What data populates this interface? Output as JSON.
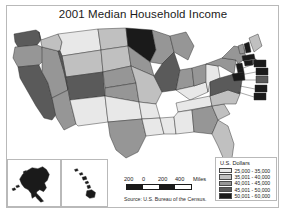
{
  "title": "2001 Median Household Income",
  "source_note": "Source: U.S. Bureau of the Census.",
  "legend": {
    "title": "U.S. Dollars",
    "classes": [
      {
        "label": "25,000 - 35,000",
        "color": "#e8e8e8"
      },
      {
        "label": "35,001 - 40,000",
        "color": "#c0c0c0"
      },
      {
        "label": "40,001 - 45,000",
        "color": "#969696"
      },
      {
        "label": "45,001 - 50,000",
        "color": "#5a5a5a"
      },
      {
        "label": "50,001 - 60,000",
        "color": "#1a1a1a"
      }
    ]
  },
  "scale_bar": {
    "units": "Miles",
    "ticks": [
      "200",
      "0",
      "200",
      "400",
      "Miles"
    ]
  },
  "insets": [
    {
      "name": "Alaska",
      "color": "#1a1a1a"
    },
    {
      "name": "Hawaii",
      "color": "#1a1a1a"
    }
  ],
  "chart_data": {
    "type": "heatmap",
    "title": "2001 Median Household Income",
    "legend_title": "U.S. Dollars",
    "legend_position": "bottom-right",
    "categories": [
      "25,000 - 35,000",
      "35,001 - 40,000",
      "40,001 - 45,000",
      "45,001 - 50,000",
      "50,001 - 60,000"
    ],
    "colors": [
      "#e8e8e8",
      "#c0c0c0",
      "#969696",
      "#5a5a5a",
      "#1a1a1a"
    ],
    "states": [
      {
        "code": "WA",
        "name": "Washington",
        "class": 3
      },
      {
        "code": "OR",
        "name": "Oregon",
        "class": 2
      },
      {
        "code": "CA",
        "name": "California",
        "class": 3
      },
      {
        "code": "NV",
        "name": "Nevada",
        "class": 2
      },
      {
        "code": "ID",
        "name": "Idaho",
        "class": 1
      },
      {
        "code": "MT",
        "name": "Montana",
        "class": 0
      },
      {
        "code": "WY",
        "name": "Wyoming",
        "class": 1
      },
      {
        "code": "UT",
        "name": "Utah",
        "class": 3
      },
      {
        "code": "AZ",
        "name": "Arizona",
        "class": 2
      },
      {
        "code": "CO",
        "name": "Colorado",
        "class": 3
      },
      {
        "code": "NM",
        "name": "New Mexico",
        "class": 0
      },
      {
        "code": "ND",
        "name": "North Dakota",
        "class": 1
      },
      {
        "code": "SD",
        "name": "South Dakota",
        "class": 1
      },
      {
        "code": "NE",
        "name": "Nebraska",
        "class": 2
      },
      {
        "code": "KS",
        "name": "Kansas",
        "class": 2
      },
      {
        "code": "OK",
        "name": "Oklahoma",
        "class": 0
      },
      {
        "code": "TX",
        "name": "Texas",
        "class": 2
      },
      {
        "code": "MN",
        "name": "Minnesota",
        "class": 4
      },
      {
        "code": "IA",
        "name": "Iowa",
        "class": 2
      },
      {
        "code": "MO",
        "name": "Missouri",
        "class": 1
      },
      {
        "code": "AR",
        "name": "Arkansas",
        "class": 0
      },
      {
        "code": "LA",
        "name": "Louisiana",
        "class": 0
      },
      {
        "code": "WI",
        "name": "Wisconsin",
        "class": 2
      },
      {
        "code": "IL",
        "name": "Illinois",
        "class": 3
      },
      {
        "code": "MS",
        "name": "Mississippi",
        "class": 0
      },
      {
        "code": "MI",
        "name": "Michigan",
        "class": 2
      },
      {
        "code": "IN",
        "name": "Indiana",
        "class": 2
      },
      {
        "code": "KY",
        "name": "Kentucky",
        "class": 0
      },
      {
        "code": "TN",
        "name": "Tennessee",
        "class": 0
      },
      {
        "code": "AL",
        "name": "Alabama",
        "class": 0
      },
      {
        "code": "OH",
        "name": "Ohio",
        "class": 2
      },
      {
        "code": "WV",
        "name": "West Virginia",
        "class": 0
      },
      {
        "code": "GA",
        "name": "Georgia",
        "class": 2
      },
      {
        "code": "FL",
        "name": "Florida",
        "class": 1
      },
      {
        "code": "SC",
        "name": "South Carolina",
        "class": 1
      },
      {
        "code": "NC",
        "name": "North Carolina",
        "class": 1
      },
      {
        "code": "VA",
        "name": "Virginia",
        "class": 3
      },
      {
        "code": "PA",
        "name": "Pennsylvania",
        "class": 2
      },
      {
        "code": "NY",
        "name": "New York",
        "class": 2
      },
      {
        "code": "VT",
        "name": "Vermont",
        "class": 2
      },
      {
        "code": "NH",
        "name": "New Hampshire",
        "class": 4
      },
      {
        "code": "ME",
        "name": "Maine",
        "class": 1
      },
      {
        "code": "MA",
        "name": "Massachusetts",
        "class": 4
      },
      {
        "code": "RI",
        "name": "Rhode Island",
        "class": 3
      },
      {
        "code": "CT",
        "name": "Connecticut",
        "class": 4
      },
      {
        "code": "NJ",
        "name": "New Jersey",
        "class": 4
      },
      {
        "code": "DE",
        "name": "Delaware",
        "class": 3
      },
      {
        "code": "MD",
        "name": "Maryland",
        "class": 4
      },
      {
        "code": "AK",
        "name": "Alaska",
        "class": 4
      },
      {
        "code": "HI",
        "name": "Hawaii",
        "class": 4
      }
    ]
  }
}
